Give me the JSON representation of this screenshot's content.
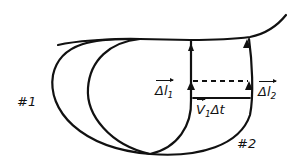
{
  "diagram": {
    "type": "flux tube / streamline sketch",
    "labels": {
      "surface_1": "#1",
      "surface_2": "#2",
      "delta_l1_main": "Δl",
      "delta_l1_sub": "1",
      "delta_l2_main": "Δl",
      "delta_l2_sub": "2",
      "v1dt_v": "V",
      "v1dt_sub": "1",
      "v1dt_rest": "Δt"
    },
    "colors": {
      "ink": "#111111",
      "background": "#ffffff"
    }
  }
}
